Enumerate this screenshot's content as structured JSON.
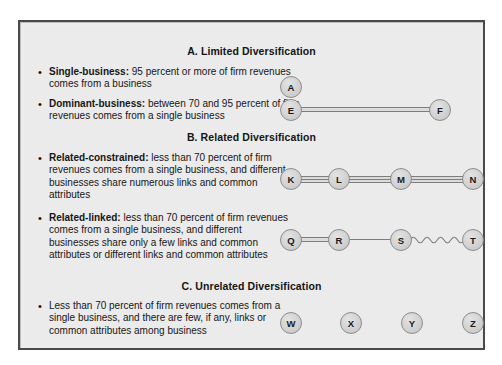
{
  "figure": {
    "background_color": "#ebebeb",
    "border_color": "#4a4a4a",
    "node_fill_color": "#d2d2d2",
    "node_border_color": "#8d8d8d",
    "connector_color": "#7d7d7d",
    "bullet_glyph": "•"
  },
  "sections": {
    "a": {
      "heading": "A. Limited Diversification",
      "bullets": {
        "single_business": {
          "term": "Single-business:",
          "body": " 95 percent or more of firm revenues comes from a business"
        },
        "dominant_business": {
          "term": "Dominant-business:",
          "body": " between 70 and 95 percent of firm revenues comes from a single business"
        }
      }
    },
    "b": {
      "heading": "B. Related Diversification",
      "bullets": {
        "related_constrained": {
          "term": "Related-constrained:",
          "body": " less than 70 percent of firm revenues comes from a single business, and different businesses share numerous links and common attributes"
        },
        "related_linked": {
          "term": "Related-linked:",
          "body": " less than 70 percent of firm revenues comes from a single business, and different businesses share only a few links and common attributes or different links and common attributes"
        }
      }
    },
    "c": {
      "heading": "C. Unrelated Diversification",
      "bullets": {
        "unrelated": {
          "term": "",
          "body": "Less than 70 percent of firm revenues comes from a single business, and there are few, if any, links or common attributes among business"
        }
      }
    }
  },
  "diagrams": {
    "single_business": {
      "nodes": [
        {
          "label": "A"
        }
      ],
      "links": []
    },
    "dominant_business": {
      "nodes": [
        {
          "label": "E"
        },
        {
          "label": "F"
        }
      ],
      "links": [
        {
          "from": "E",
          "to": "F",
          "style": "double"
        }
      ]
    },
    "related_constrained": {
      "nodes": [
        {
          "label": "K"
        },
        {
          "label": "L"
        },
        {
          "label": "M"
        },
        {
          "label": "N"
        }
      ],
      "links": [
        {
          "from": "K",
          "to": "L",
          "style": "triple"
        },
        {
          "from": "L",
          "to": "M",
          "style": "triple"
        },
        {
          "from": "M",
          "to": "N",
          "style": "triple"
        }
      ]
    },
    "related_linked": {
      "nodes": [
        {
          "label": "Q"
        },
        {
          "label": "R"
        },
        {
          "label": "S"
        },
        {
          "label": "T"
        }
      ],
      "links": [
        {
          "from": "Q",
          "to": "R",
          "style": "double"
        },
        {
          "from": "R",
          "to": "S",
          "style": "single"
        },
        {
          "from": "S",
          "to": "T",
          "style": "wavy"
        }
      ]
    },
    "unrelated": {
      "nodes": [
        {
          "label": "W"
        },
        {
          "label": "X"
        },
        {
          "label": "Y"
        },
        {
          "label": "Z"
        }
      ],
      "links": []
    }
  }
}
